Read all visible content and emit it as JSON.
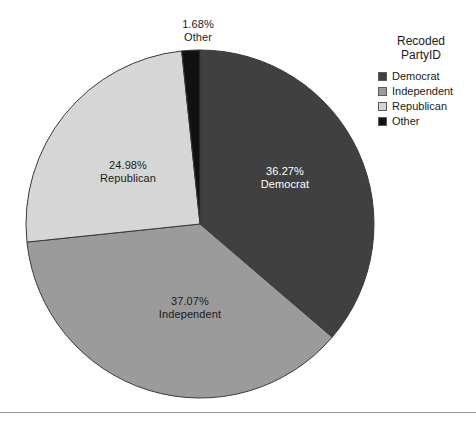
{
  "chart_data": {
    "type": "pie",
    "title": "",
    "legend_title": "Recoded\nPartyID",
    "legend_position": "right",
    "grid": false,
    "categories": [
      "Democrat",
      "Independent",
      "Republican",
      "Other"
    ],
    "values": [
      36.27,
      37.07,
      24.98,
      1.68
    ],
    "value_unit": "%",
    "value_labels": [
      "36.27%",
      "37.07%",
      "24.98%",
      "1.68%"
    ],
    "colors": [
      "#404040",
      "#9b9b9b",
      "#d6d6d6",
      "#111111"
    ],
    "label_text_colors": [
      "#ffffff",
      "#1a1a1a",
      "#1a1a1a",
      "#1a1a1a"
    ],
    "start_angle_deg": 0,
    "direction": "clockwise",
    "center": {
      "x": 200,
      "y": 224
    },
    "radius": 174,
    "slices": [
      {
        "name": "Democrat",
        "value": 36.27,
        "percent_label": "36.27%",
        "color": "#404040",
        "start_deg": 0,
        "end_deg": 130.572,
        "label_x": 285,
        "label_y": 178,
        "label_on": "dark",
        "label_placement": "inside"
      },
      {
        "name": "Independent",
        "value": 37.07,
        "percent_label": "37.07%",
        "color": "#9b9b9b",
        "start_deg": 130.572,
        "end_deg": 264.024,
        "label_x": 190,
        "label_y": 308,
        "label_on": "light",
        "label_placement": "inside"
      },
      {
        "name": "Republican",
        "value": 24.98,
        "percent_label": "24.98%",
        "color": "#d6d6d6",
        "start_deg": 264.024,
        "end_deg": 353.952,
        "label_x": 128,
        "label_y": 172,
        "label_on": "light",
        "label_placement": "inside"
      },
      {
        "name": "Other",
        "value": 1.68,
        "percent_label": "1.68%",
        "color": "#111111",
        "start_deg": 353.952,
        "end_deg": 360,
        "label_x": 198,
        "label_y": 18,
        "label_on": "light",
        "label_placement": "outside"
      }
    ]
  },
  "legend": {
    "title_line1": "Recoded",
    "title_line2": "PartyID",
    "items": [
      {
        "label": "Democrat",
        "color": "#404040"
      },
      {
        "label": "Independent",
        "color": "#9b9b9b"
      },
      {
        "label": "Republican",
        "color": "#d6d6d6"
      },
      {
        "label": "Other",
        "color": "#111111"
      }
    ]
  },
  "footer": {
    "artifact_text": ""
  },
  "style": {
    "background": "#ffffff",
    "slice_outline": "#3a3a3a",
    "rule_color": "#9a9a9a"
  }
}
